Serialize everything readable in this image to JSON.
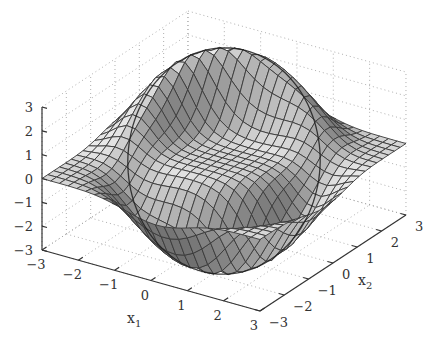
{
  "chart_data": {
    "type": "surface3d",
    "title": "",
    "xlabel": "x1",
    "ylabel": "x2",
    "zlabel": "",
    "x_ticks": [
      -3,
      -2,
      -1,
      0,
      1,
      2,
      3
    ],
    "y_ticks": [
      -3,
      -2,
      -1,
      0,
      1,
      2,
      3
    ],
    "z_ticks": [
      -3,
      -2,
      -1,
      0,
      1,
      2,
      3
    ],
    "xlim": [
      -3,
      3
    ],
    "ylim": [
      -3,
      3
    ],
    "zlim": [
      -3,
      3
    ],
    "grid": true,
    "grid_style": "dotted",
    "colormap": "gray",
    "mesh_resolution": 25,
    "surface_description": "Surface is ~0 (flat) outside a ring; along a circle of radius ~2.2 it rises to a ridge of ~+3 on the back-left side (x1<0, x2>0) and falls to a trough of ~-3 on the front-right side (x1>0, x2<0). A dark circular contour is drawn on the surface along the ring.",
    "features": [
      {
        "name": "peak",
        "x1": -1.2,
        "x2": 1.8,
        "z": 3
      },
      {
        "name": "trough",
        "x1": 1.6,
        "x2": -1.4,
        "z": -3
      }
    ],
    "contour_ring_radius": 2.2,
    "view": {
      "azimuth_deg": -37.5,
      "elevation_deg": 30
    }
  },
  "axes": {
    "x_label_main": "x",
    "x_label_sub": "1",
    "y_label_main": "x",
    "y_label_sub": "2",
    "z_tick_labels": [
      "3",
      "2",
      "1",
      "0",
      "−1",
      "−2",
      "−3"
    ],
    "x_tick_labels": [
      "−3",
      "−2",
      "−1",
      "0",
      "1",
      "2",
      "3"
    ],
    "y_tick_labels": [
      "−3",
      "−2",
      "−1",
      "0",
      "1",
      "2",
      "3"
    ]
  }
}
